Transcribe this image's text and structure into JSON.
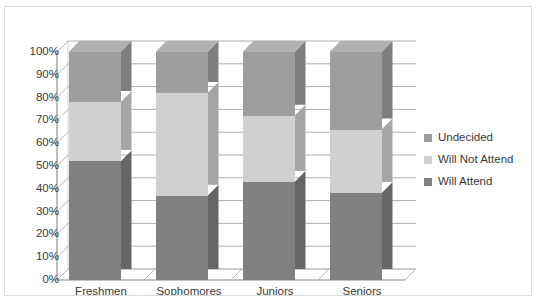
{
  "chart_data": {
    "type": "bar",
    "subtype": "stacked-100-percent-3d",
    "title": "",
    "xlabel": "",
    "ylabel": "",
    "categories": [
      "Freshmen",
      "Sophomores",
      "Juniors",
      "Seniors"
    ],
    "series": [
      {
        "name": "Will Attend",
        "color": "#808080",
        "values": [
          52,
          37,
          43,
          38
        ]
      },
      {
        "name": "Will Not Attend",
        "color": "#d0d0d0",
        "values": [
          26,
          45,
          29,
          28
        ]
      },
      {
        "name": "Undecided",
        "color": "#9e9e9e",
        "values": [
          22,
          18,
          28,
          34
        ]
      }
    ],
    "ylim": [
      0,
      100
    ],
    "ytick_values": [
      0,
      10,
      20,
      30,
      40,
      50,
      60,
      70,
      80,
      90,
      100
    ],
    "ytick_labels": [
      "0%",
      "10%",
      "20%",
      "30%",
      "40%",
      "50%",
      "60%",
      "70%",
      "80%",
      "90%",
      "100%"
    ],
    "grid": true,
    "grid_axis": "y",
    "legend_position": "right",
    "legend_order": [
      "Undecided",
      "Will Not Attend",
      "Will Attend"
    ]
  },
  "legend": {
    "items": [
      {
        "label": "Undecided",
        "color": "#9e9e9e"
      },
      {
        "label": "Will Not Attend",
        "color": "#d0d0d0"
      },
      {
        "label": "Will Attend",
        "color": "#808080"
      }
    ]
  },
  "axes": {
    "y_labels": [
      "100%",
      "90%",
      "80%",
      "70%",
      "60%",
      "50%",
      "40%",
      "30%",
      "20%",
      "10%",
      "0%"
    ],
    "x_labels": [
      "Freshmen",
      "Sophomores",
      "Juniors",
      "Seniors"
    ]
  },
  "style": {
    "plot_border": "#dcdcdc",
    "gridline": "#a6a6a6",
    "axis_line": "#a6a6a6",
    "text": "#3a3a3a",
    "background": "#ffffff"
  },
  "title_strip": ""
}
